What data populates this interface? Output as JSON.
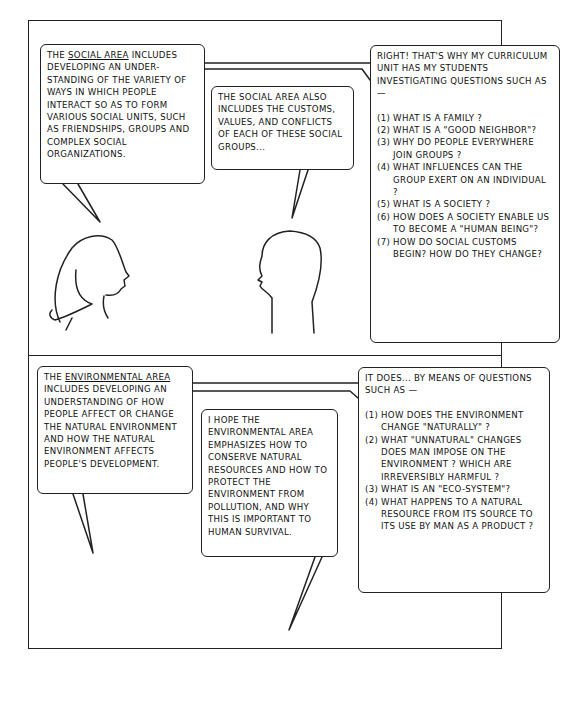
{
  "panels": [
    {
      "id": "social",
      "bubbles": {
        "left": {
          "lead": "The ",
          "underlined": "social area",
          "rest": " includes developing an under-standing of the variety of ways in which people interact so as to form various social units, such as friendships, groups and complex social organizations."
        },
        "middle": {
          "text": "The social area also includes the customs, values, and conflicts of each of these social groups..."
        },
        "right": {
          "intro": "Right! That's why my curriculum unit has my students investigating questions such as —",
          "questions": [
            "(1) What is a family ?",
            "(2) What is a \"good neighbor\"?",
            "(3) Why do people everywhere join groups ?",
            "(4) What influences can the group exert on an individual ?",
            "(5) What is a society ?",
            "(6) How does a society enable us to become a \"human being\"?",
            "(7) How do social customs begin? How do they change?"
          ]
        }
      }
    },
    {
      "id": "environmental",
      "bubbles": {
        "left": {
          "lead": "The ",
          "underlined": "environmental area",
          "rest": " includes developing an understanding of how people affect or change the natural environment and how the natural environment affects people's development."
        },
        "middle": {
          "text": "I hope the environmental area emphasizes how to conserve natural resources and how to protect the environment from pollution, and why this is important to human survival."
        },
        "right": {
          "intro": "It does... by means of questions such as —",
          "questions": [
            "(1) How does the environment change \"naturally\" ?",
            "(2) What \"unnatural\" changes does man impose on the environment ? Which are irreversibly harmful ?",
            "(3) What is an \"eco-system\"?",
            "(4) What happens to a natural resource from its source to its use by man as a product ?"
          ]
        }
      }
    }
  ]
}
